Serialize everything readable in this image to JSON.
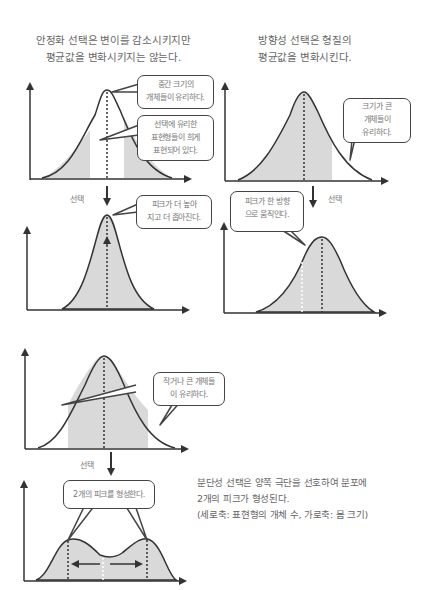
{
  "stabilizing": {
    "caption_lines": [
      "안정화 선택은 변이를 감소시키지만",
      "평균값을 변화시키지는 않는다."
    ],
    "bubble_middle": [
      "중간 크기의",
      "개체들이 유리하다."
    ],
    "bubble_rare": [
      "선택에 유리한",
      "표현형들이 희게",
      "표현되어 있다."
    ],
    "selection_label": "선택",
    "bubble_after": [
      "피크가 더 높아",
      "지고 더 좁아진다."
    ]
  },
  "directional": {
    "caption_lines": [
      "방향성 선택은 형질의",
      "평균값을 변화시킨다."
    ],
    "bubble_large": [
      "크기가 큰",
      "개체들이",
      "유리하다."
    ],
    "selection_label": "선택",
    "bubble_after": [
      "피크가 한 방향",
      "으로 움직인다."
    ]
  },
  "disruptive": {
    "bubble_extremes": [
      "작거나 큰 개체들",
      "이 유리하다."
    ],
    "selection_label": "선택",
    "bubble_after": [
      "2개의 피크를 형성한다."
    ],
    "caption_lines": [
      "분단성 선택은 양쪽 극단을 선호하여 분포에",
      "2개의 피크가 형성된다.",
      "(세로축: 표현형의 개체 수, 가로축: 몸 크기)"
    ]
  },
  "colors": {
    "axis": "#333333",
    "curve": "#333333",
    "shade": "#d9d9d9",
    "text": "#666666"
  }
}
